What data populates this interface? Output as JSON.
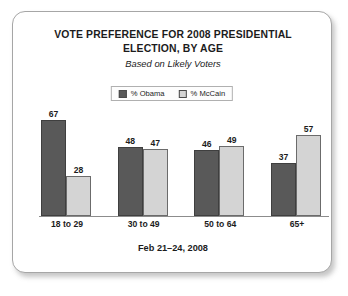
{
  "card": {
    "title": "VOTE PREFERENCE FOR 2008 PRESIDENTIAL ELECTION, BY AGE",
    "subtitle": "Based on Likely Voters",
    "footer": "Feb 21–24, 2008"
  },
  "legend": {
    "items": [
      {
        "label": "% Obama",
        "color": "#595959"
      },
      {
        "label": "% McCain",
        "color": "#d4d4d4"
      }
    ]
  },
  "chart_data": {
    "type": "bar",
    "title": "VOTE PREFERENCE FOR 2008 PRESIDENTIAL ELECTION, BY AGE",
    "subtitle": "Based on Likely Voters",
    "note": "Feb 21–24, 2008",
    "xlabel": "",
    "ylabel": "",
    "ylim": [
      0,
      70
    ],
    "grid": false,
    "legend_position": "top-center",
    "categories": [
      "18 to 29",
      "30 to 49",
      "50 to 64",
      "65+"
    ],
    "series": [
      {
        "name": "% Obama",
        "color": "#595959",
        "values": [
          67,
          48,
          46,
          37
        ]
      },
      {
        "name": "% McCain",
        "color": "#d4d4d4",
        "values": [
          28,
          47,
          49,
          57
        ]
      }
    ],
    "bars": [
      {
        "category": "18 to 29",
        "obama": 67,
        "mccain": 28
      },
      {
        "category": "30 to 49",
        "obama": 48,
        "mccain": 47
      },
      {
        "category": "50 to 64",
        "obama": 46,
        "mccain": 49
      },
      {
        "category": "65+",
        "obama": 37,
        "mccain": 57
      }
    ]
  }
}
